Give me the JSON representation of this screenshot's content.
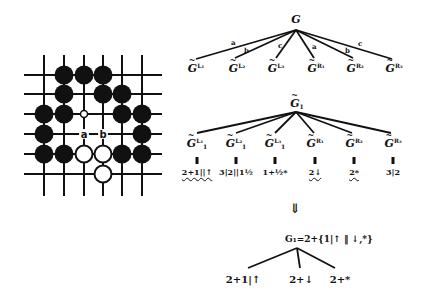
{
  "board": {
    "cols": [
      44,
      64,
      84,
      103,
      122,
      142
    ],
    "rows": [
      75,
      94,
      114,
      134,
      154,
      174
    ],
    "line_extent": {
      "x_min": 24,
      "x_max": 162,
      "y_min": 55,
      "y_max": 196
    },
    "black_stones": [
      [
        1,
        0
      ],
      [
        2,
        0
      ],
      [
        3,
        0
      ],
      [
        1,
        1
      ],
      [
        3,
        1
      ],
      [
        4,
        1
      ],
      [
        0,
        2
      ],
      [
        1,
        2
      ],
      [
        4,
        2
      ],
      [
        5,
        2
      ],
      [
        0,
        3
      ],
      [
        5,
        3
      ],
      [
        0,
        4
      ],
      [
        1,
        4
      ],
      [
        4,
        4
      ],
      [
        5,
        4
      ]
    ],
    "white_stones": [
      [
        2,
        4
      ],
      [
        3,
        4
      ],
      [
        3,
        5
      ]
    ],
    "small_white_marker": [
      2,
      2
    ],
    "point_labels": [
      {
        "text": "a",
        "col": 2,
        "row": 3
      },
      {
        "text": "b",
        "col": 3,
        "row": 3
      }
    ]
  },
  "tree1": {
    "root": {
      "label": "G",
      "x": 296,
      "y": 14
    },
    "root_point": [
      296,
      30
    ],
    "edge_labels": [
      {
        "text": "a",
        "x": 231,
        "y": 39
      },
      {
        "text": "b",
        "x": 244,
        "y": 47
      },
      {
        "text": "c",
        "x": 278,
        "y": 42
      },
      {
        "text": "a",
        "x": 312,
        "y": 43
      },
      {
        "text": "b",
        "x": 345,
        "y": 47
      },
      {
        "text": "c",
        "x": 358,
        "y": 40
      }
    ],
    "leaves": [
      {
        "label": "G",
        "sup": "L₁",
        "x": 196,
        "line_end": [
          196,
          59
        ]
      },
      {
        "label": "G",
        "sup": "L₂",
        "x": 237,
        "line_end": [
          235,
          58
        ]
      },
      {
        "label": "G",
        "sup": "L₃",
        "x": 276,
        "line_end": [
          276,
          58
        ]
      },
      {
        "label": "G",
        "sup": "R₁",
        "x": 316,
        "line_end": [
          314,
          58
        ]
      },
      {
        "label": "G",
        "sup": "R₂",
        "x": 355,
        "line_end": [
          353,
          58
        ]
      },
      {
        "label": "G",
        "sup": "R₃",
        "x": 394,
        "line_end": [
          392,
          59
        ]
      }
    ]
  },
  "tree2": {
    "root": {
      "label": "G",
      "sub": "1",
      "x": 297,
      "y": 98
    },
    "root_point": [
      296,
      112
    ],
    "leaves": [
      {
        "label": "G",
        "sup": "L₁",
        "sub": "1",
        "x": 197,
        "line_end": [
          197,
          133
        ],
        "value": "2+1||↑",
        "wavy": true
      },
      {
        "label": "G",
        "sup": "L₂",
        "sub": "1",
        "x": 236,
        "line_end": [
          236,
          133
        ],
        "value": "3|2||1½",
        "wavy": false
      },
      {
        "label": "G",
        "sup": "L₃",
        "sub": "1",
        "x": 275,
        "line_end": [
          275,
          133
        ],
        "value": "1+½*",
        "wavy": false
      },
      {
        "label": "G",
        "sup": "R₁",
        "sub": "",
        "x": 315,
        "line_end": [
          314,
          133
        ],
        "value": "2↓",
        "wavy": true
      },
      {
        "label": "G",
        "sup": "R₂",
        "sub": "",
        "x": 354,
        "line_end": [
          352,
          133
        ],
        "value": "2*",
        "wavy": true
      },
      {
        "label": "G",
        "sup": "R₃",
        "sub": "",
        "x": 393,
        "line_end": [
          391,
          133
        ],
        "value": "3|2",
        "wavy": false
      }
    ]
  },
  "transition_arrow": "⇓",
  "result": {
    "equation": "G₁=2+{1|↑ ‖ ↓,*}",
    "root_point": [
      297,
      248
    ],
    "children": [
      {
        "text": "2+1|↑",
        "x": 243,
        "line_end": [
          248,
          268
        ]
      },
      {
        "text": "2+↓",
        "x": 301,
        "line_end": [
          300,
          268
        ]
      },
      {
        "text": "2+*",
        "x": 340,
        "line_end": [
          335,
          268
        ]
      }
    ]
  }
}
